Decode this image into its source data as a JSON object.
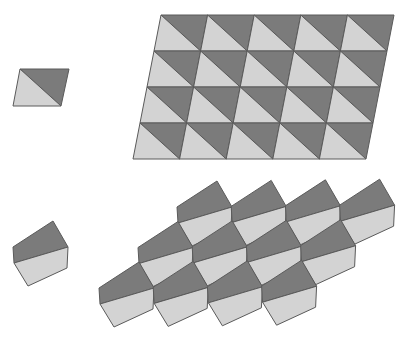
{
  "colors": {
    "dark": "#7b7b7b",
    "light": "#d3d3d3",
    "edge": "#5a5a5a",
    "background": "#ffffff"
  },
  "parallelogram_tile": {
    "corners": {
      "tl": [
        20,
        69
      ],
      "tr": [
        69,
        69
      ],
      "br": [
        61,
        106
      ],
      "bl": [
        13,
        106
      ]
    },
    "split": "tl-br",
    "dark_half": "upper-right",
    "light_half": "lower-left"
  },
  "parallelogram_tiling": {
    "origin_tl": [
      161,
      15
    ],
    "columns": 5,
    "rows": 4,
    "cell_width": 46.6,
    "row_height": 36,
    "shear_per_row": -7,
    "split": "tl-br",
    "dark_half": "upper-right",
    "light_half": "lower-left"
  },
  "pentagon_tile": {
    "top": [
      53,
      221
    ],
    "offsets": {
      "lt": [
        -40,
        26
      ],
      "lb": [
        -39,
        42
      ],
      "bottom": [
        -25,
        65
      ],
      "rb": [
        14,
        47
      ],
      "right": [
        15,
        26
      ]
    },
    "split": "lb-right",
    "dark_half": "upper",
    "light_half": "lower"
  },
  "pentagon_tiling": {
    "origin_top": [
      217,
      181
    ],
    "vector_a": [
      54.2,
      -0.6
    ],
    "vector_b": [
      -39,
      40.5
    ],
    "rows": 3,
    "tiles_per_row": 4
  }
}
